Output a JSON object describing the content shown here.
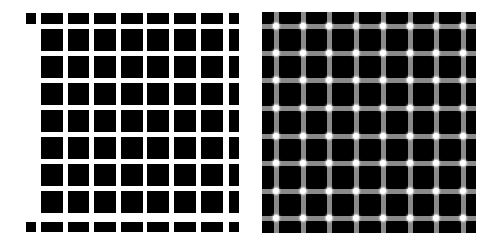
{
  "figure": {
    "left_panel": {
      "name": "hermann-grid",
      "background": "#ffffff",
      "block_color": "#000000",
      "columns_x": [
        [
          26,
          36
        ],
        [
          41,
          63
        ],
        [
          68,
          89
        ],
        [
          94,
          116
        ],
        [
          121,
          143
        ],
        [
          147,
          169
        ],
        [
          174,
          196
        ],
        [
          201,
          223
        ],
        [
          229,
          239
        ]
      ],
      "rows_y": [
        [
          13,
          24
        ],
        [
          29,
          51
        ],
        [
          56,
          78
        ],
        [
          83,
          105
        ],
        [
          110,
          132
        ],
        [
          137,
          159
        ],
        [
          164,
          186
        ],
        [
          191,
          213
        ],
        [
          222,
          232
        ]
      ],
      "left_column_interior_blank": true
    },
    "right_panel": {
      "name": "scintillating-grid",
      "background": "#000000",
      "bounds": {
        "x": 262,
        "y": 12,
        "w": 214,
        "h": 221
      },
      "line_color": "#8a8a8a",
      "line_width": 5,
      "dot_color": "#ffffff",
      "vertical_lines_x": [
        276,
        303,
        329,
        356,
        383,
        410,
        436,
        463
      ],
      "horizontal_lines_y": [
        26,
        53,
        80,
        108,
        136,
        163,
        191,
        218
      ]
    }
  }
}
